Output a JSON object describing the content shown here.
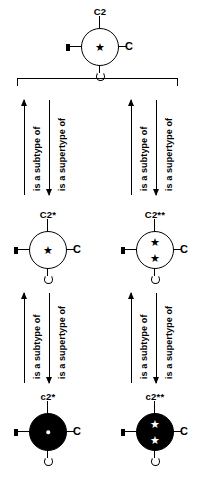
{
  "diagram": {
    "relations": {
      "subtype_label": "is a subtype of",
      "supertype_label": "is a supertype of"
    },
    "port_labels": {
      "right_socket": "C"
    },
    "nodes": [
      {
        "id": "c2-top",
        "label": "C2",
        "fill": "white",
        "stars": 1,
        "star_color": "black",
        "dot": false
      },
      {
        "id": "c2-star-left",
        "label": "C2*",
        "fill": "white",
        "stars": 1,
        "star_color": "black",
        "dot": false
      },
      {
        "id": "c2-starstar-right",
        "label": "C2**",
        "fill": "white",
        "stars": 2,
        "star_color": "black",
        "dot": false
      },
      {
        "id": "c2-lower-star-left",
        "label": "c2*",
        "fill": "black",
        "stars": 0,
        "star_color": "white",
        "dot": true
      },
      {
        "id": "c2-lower-starstar-right",
        "label": "c2**",
        "fill": "black",
        "stars": 2,
        "star_color": "white",
        "dot": false
      }
    ],
    "arrow_groups": [
      {
        "id": "left-upper",
        "up": "is a subtype of",
        "down": "is a supertype of"
      },
      {
        "id": "right-upper",
        "up": "is a subtype of",
        "down": "is a supertype of"
      },
      {
        "id": "left-lower",
        "up": "is a subtype of",
        "down": "is a supertype of"
      },
      {
        "id": "right-lower",
        "up": "is a subtype of",
        "down": "is a supertype of"
      }
    ],
    "colors": {
      "stroke": "#000000",
      "background": "#ffffff",
      "fill_solid": "#000000",
      "fill_open": "#ffffff"
    },
    "glyphs": {
      "star": "★"
    }
  }
}
